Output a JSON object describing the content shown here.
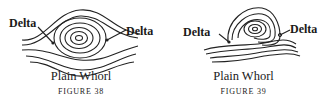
{
  "figures": [
    {
      "title": "Plain Whorl",
      "caption": "FIGURE 38",
      "labels": {
        "left": "Delta",
        "right": "Delta"
      }
    },
    {
      "title": "Plain Whorl",
      "caption": "FIGURE 39",
      "labels": {
        "left": "Delta",
        "right": "Delta"
      }
    }
  ]
}
